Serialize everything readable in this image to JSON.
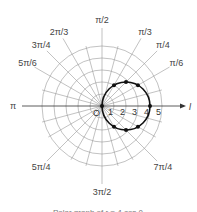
{
  "chart_data": {
    "type": "line",
    "coordinate_system": "polar",
    "title": "",
    "curve": "r = 4 cos θ",
    "radial_ticks": [
      "1",
      "2",
      "3",
      "4",
      "5"
    ],
    "radial_range": [
      0,
      5
    ],
    "origin_label": "O",
    "polar_axis_label": "l",
    "angle_labels": [
      {
        "label": "π/6",
        "angle_deg": 30
      },
      {
        "label": "π/4",
        "angle_deg": 45
      },
      {
        "label": "π/3",
        "angle_deg": 60
      },
      {
        "label": "π/2",
        "angle_deg": 90
      },
      {
        "label": "2π/3",
        "angle_deg": 120
      },
      {
        "label": "3π/4",
        "angle_deg": 135
      },
      {
        "label": "5π/6",
        "angle_deg": 150
      },
      {
        "label": "π",
        "angle_deg": 180
      },
      {
        "label": "5π/4",
        "angle_deg": 225
      },
      {
        "label": "3π/2",
        "angle_deg": 270
      },
      {
        "label": "7π/4",
        "angle_deg": 315
      }
    ],
    "points": [
      {
        "theta": "0",
        "r": 4
      },
      {
        "theta": "π/6",
        "r": 3.46
      },
      {
        "theta": "π/4",
        "r": 2.83
      },
      {
        "theta": "π/3",
        "r": 2
      },
      {
        "theta": "π/2",
        "r": 0
      },
      {
        "theta": "-π/6",
        "r": 3.46
      },
      {
        "theta": "-π/4",
        "r": 2.83
      },
      {
        "theta": "-π/3",
        "r": 2
      }
    ],
    "grid": true,
    "legend": null
  },
  "caption": "Polar graph of r = 4 cos θ"
}
